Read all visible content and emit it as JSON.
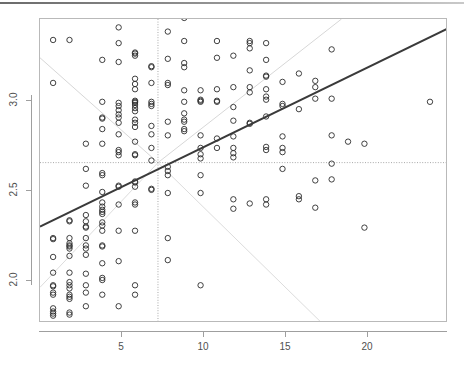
{
  "chart_data": {
    "type": "scatter",
    "title": "",
    "xlabel": "",
    "ylabel": "",
    "xlim": [
      0.2,
      25.1
    ],
    "ylim": [
      1.82,
      3.27
    ],
    "xticks": [
      5,
      10,
      15,
      20
    ],
    "yticks": [
      2.0,
      2.5,
      3.0
    ],
    "xtick_labels": [
      "5",
      "10",
      "15",
      "20"
    ],
    "ytick_labels": [
      "2.0",
      "2.5",
      "3.0"
    ],
    "grid": false,
    "legend": "none",
    "marker": "open-circle",
    "marker_color": "#2b2b2b",
    "points": [
      [
        1,
        3.17
      ],
      [
        1,
        2.965
      ],
      [
        1,
        2.225
      ],
      [
        1,
        2.22
      ],
      [
        1,
        2.135
      ],
      [
        1,
        2.06
      ],
      [
        1,
        2.0
      ],
      [
        1,
        1.995
      ],
      [
        1,
        1.965
      ],
      [
        1,
        1.955
      ],
      [
        1,
        1.89
      ],
      [
        1,
        1.875
      ],
      [
        1,
        1.865
      ],
      [
        1,
        1.855
      ],
      [
        2,
        3.17
      ],
      [
        2,
        2.31
      ],
      [
        2,
        2.305
      ],
      [
        2,
        2.225
      ],
      [
        2,
        2.2
      ],
      [
        2,
        2.19
      ],
      [
        2,
        2.185
      ],
      [
        2,
        2.175
      ],
      [
        2,
        2.14
      ],
      [
        2,
        2.06
      ],
      [
        2,
        2.015
      ],
      [
        2,
        2.0
      ],
      [
        2,
        1.985
      ],
      [
        2,
        1.955
      ],
      [
        2,
        1.945
      ],
      [
        2,
        1.935
      ],
      [
        2,
        1.87
      ],
      [
        2,
        1.86
      ],
      [
        3,
        2.675
      ],
      [
        3,
        2.555
      ],
      [
        3,
        2.475
      ],
      [
        3,
        2.335
      ],
      [
        3,
        2.305
      ],
      [
        3,
        2.28
      ],
      [
        3,
        2.275
      ],
      [
        3,
        2.225
      ],
      [
        3,
        2.19
      ],
      [
        3,
        2.175
      ],
      [
        3,
        2.145
      ],
      [
        3,
        2.055
      ],
      [
        3,
        2.0
      ],
      [
        3,
        1.965
      ],
      [
        3,
        1.9
      ],
      [
        4,
        3.075
      ],
      [
        4,
        2.875
      ],
      [
        4,
        2.8
      ],
      [
        4,
        2.795
      ],
      [
        4,
        2.745
      ],
      [
        4,
        2.675
      ],
      [
        4,
        2.535
      ],
      [
        4,
        2.525
      ],
      [
        4,
        2.445
      ],
      [
        4,
        2.395
      ],
      [
        4,
        2.375
      ],
      [
        4,
        2.36
      ],
      [
        4,
        2.35
      ],
      [
        4,
        2.34
      ],
      [
        4,
        2.3
      ],
      [
        4,
        2.285
      ],
      [
        4,
        2.26
      ],
      [
        4,
        2.19
      ],
      [
        4,
        2.185
      ],
      [
        4,
        2.105
      ],
      [
        4,
        2.035
      ],
      [
        4,
        2.025
      ],
      [
        4,
        1.955
      ],
      [
        5,
        3.23
      ],
      [
        5,
        3.155
      ],
      [
        5,
        3.065
      ],
      [
        5,
        2.87
      ],
      [
        5,
        2.855
      ],
      [
        5,
        2.835
      ],
      [
        5,
        2.815
      ],
      [
        5,
        2.8
      ],
      [
        5,
        2.775
      ],
      [
        5,
        2.72
      ],
      [
        5,
        2.645
      ],
      [
        5,
        2.635
      ],
      [
        5,
        2.62
      ],
      [
        5,
        2.475
      ],
      [
        5,
        2.47
      ],
      [
        5,
        2.385
      ],
      [
        5,
        2.26
      ],
      [
        5,
        2.115
      ],
      [
        5,
        1.9
      ],
      [
        6,
        3.11
      ],
      [
        6,
        3.105
      ],
      [
        6,
        3.095
      ],
      [
        6,
        2.985
      ],
      [
        6,
        2.96
      ],
      [
        6,
        2.935
      ],
      [
        6,
        2.88
      ],
      [
        6,
        2.875
      ],
      [
        6,
        2.87
      ],
      [
        6,
        2.86
      ],
      [
        6,
        2.845
      ],
      [
        6,
        2.83
      ],
      [
        6,
        2.79
      ],
      [
        6,
        2.775
      ],
      [
        6,
        2.755
      ],
      [
        6,
        2.685
      ],
      [
        6,
        2.625
      ],
      [
        6,
        2.62
      ],
      [
        6,
        2.495
      ],
      [
        6,
        2.49
      ],
      [
        6,
        2.47
      ],
      [
        6,
        2.395
      ],
      [
        6,
        2.385
      ],
      [
        6,
        2.26
      ],
      [
        6,
        2.0
      ],
      [
        6,
        1.955
      ],
      [
        7,
        3.045
      ],
      [
        7,
        3.04
      ],
      [
        7,
        2.965
      ],
      [
        7,
        2.875
      ],
      [
        7,
        2.865
      ],
      [
        7,
        2.855
      ],
      [
        7,
        2.76
      ],
      [
        7,
        2.72
      ],
      [
        7,
        2.655
      ],
      [
        7,
        2.595
      ],
      [
        7,
        2.46
      ],
      [
        7,
        2.455
      ],
      [
        8,
        3.21
      ],
      [
        8,
        3.08
      ],
      [
        8,
        2.965
      ],
      [
        8,
        2.955
      ],
      [
        8,
        2.78
      ],
      [
        8,
        2.715
      ],
      [
        8,
        2.565
      ],
      [
        8,
        2.545
      ],
      [
        8,
        2.525
      ],
      [
        8,
        2.44
      ],
      [
        8,
        2.225
      ],
      [
        8,
        2.12
      ],
      [
        9,
        3.275
      ],
      [
        9,
        3.165
      ],
      [
        9,
        3.06
      ],
      [
        9,
        3.04
      ],
      [
        9,
        2.93
      ],
      [
        9,
        2.875
      ],
      [
        9,
        2.82
      ],
      [
        9,
        2.79
      ],
      [
        9,
        2.78
      ],
      [
        9,
        2.745
      ],
      [
        9,
        2.735
      ],
      [
        10,
        3.34
      ],
      [
        10,
        2.93
      ],
      [
        10,
        2.885
      ],
      [
        10,
        2.88
      ],
      [
        10,
        2.875
      ],
      [
        10,
        2.715
      ],
      [
        10,
        2.655
      ],
      [
        10,
        2.625
      ],
      [
        10,
        2.605
      ],
      [
        10,
        2.525
      ],
      [
        10,
        2.44
      ],
      [
        10,
        2.0
      ],
      [
        11,
        3.165
      ],
      [
        11,
        3.085
      ],
      [
        11,
        2.935
      ],
      [
        11,
        2.88
      ],
      [
        11,
        2.875
      ],
      [
        11,
        2.7
      ],
      [
        11,
        2.655
      ],
      [
        12,
        3.095
      ],
      [
        12,
        2.945
      ],
      [
        12,
        2.85
      ],
      [
        12,
        2.785
      ],
      [
        12,
        2.71
      ],
      [
        12,
        2.655
      ],
      [
        12,
        2.63
      ],
      [
        12,
        2.61
      ],
      [
        12,
        2.41
      ],
      [
        12,
        2.365
      ],
      [
        13,
        3.34
      ],
      [
        13,
        3.165
      ],
      [
        13,
        3.155
      ],
      [
        13,
        3.13
      ],
      [
        13,
        3.025
      ],
      [
        13,
        2.945
      ],
      [
        13,
        2.92
      ],
      [
        13,
        2.775
      ],
      [
        13,
        2.77
      ],
      [
        13,
        2.39
      ],
      [
        14,
        3.155
      ],
      [
        14,
        3.075
      ],
      [
        14,
        3.0
      ],
      [
        14,
        2.995
      ],
      [
        14,
        2.935
      ],
      [
        14,
        2.9
      ],
      [
        14,
        2.885
      ],
      [
        14,
        2.805
      ],
      [
        14,
        2.66
      ],
      [
        14,
        2.645
      ],
      [
        14,
        2.41
      ],
      [
        14,
        2.385
      ],
      [
        15,
        2.97
      ],
      [
        15,
        2.865
      ],
      [
        15,
        2.855
      ],
      [
        15,
        2.71
      ],
      [
        15,
        2.655
      ],
      [
        15,
        2.635
      ],
      [
        15,
        2.555
      ],
      [
        16,
        3.01
      ],
      [
        16,
        2.84
      ],
      [
        16,
        2.425
      ],
      [
        16,
        2.41
      ],
      [
        17,
        2.975
      ],
      [
        17,
        2.945
      ],
      [
        17,
        2.89
      ],
      [
        17,
        2.5
      ],
      [
        17,
        2.37
      ],
      [
        18,
        3.125
      ],
      [
        18,
        2.89
      ],
      [
        18,
        2.715
      ],
      [
        18,
        2.58
      ],
      [
        18,
        2.505
      ],
      [
        19,
        2.685
      ],
      [
        20,
        2.675
      ],
      [
        20,
        2.275
      ],
      [
        24,
        2.875
      ]
    ],
    "lines": [
      {
        "name": "regression-line",
        "style": "solid",
        "color": "#3a3a3a",
        "width": 2,
        "x1": 0.2,
        "y1": 2.28,
        "x2": 25.1,
        "y2": 3.225
      },
      {
        "name": "reference-line-descending-upper",
        "style": "solid",
        "color": "#d7d7d7",
        "width": 1,
        "x1": 0.2,
        "y1": 3.085,
        "x2": 7.4,
        "y2": 2.585
      },
      {
        "name": "reference-line-ascending-upper",
        "style": "solid",
        "color": "#d7d7d7",
        "width": 1,
        "x1": 7.4,
        "y1": 2.585,
        "x2": 18.6,
        "y2": 3.27
      },
      {
        "name": "reference-line-ascending-lower",
        "style": "solid",
        "color": "#dcdcdc",
        "width": 1,
        "x1": 0.2,
        "y1": 1.99,
        "x2": 7.4,
        "y2": 2.585
      },
      {
        "name": "reference-line-descending-lower",
        "style": "solid",
        "color": "#dcdcdc",
        "width": 1,
        "x1": 7.4,
        "y1": 2.585,
        "x2": 17.4,
        "y2": 1.82
      }
    ],
    "reference_lines": [
      {
        "name": "vertical-dotted-line",
        "orientation": "vertical",
        "style": "dotted",
        "color": "#a8a8a8",
        "value": 7.4
      },
      {
        "name": "horizontal-dotted-line",
        "orientation": "horizontal",
        "style": "dotted",
        "color": "#a8a8a8",
        "value": 2.585
      }
    ]
  },
  "axis": {
    "x_labels": [
      "5",
      "10",
      "15",
      "20"
    ],
    "y_labels": [
      "3.0",
      "2.5",
      "2.0"
    ]
  }
}
